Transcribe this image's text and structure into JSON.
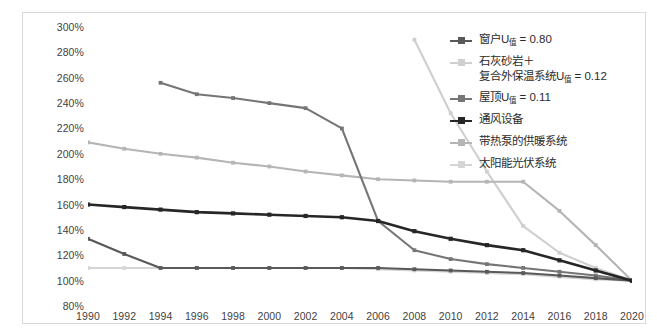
{
  "chart_data": {
    "type": "line",
    "title": "",
    "xlabel": "",
    "ylabel": "",
    "x": [
      1990,
      1992,
      1994,
      1996,
      1998,
      2000,
      2002,
      2004,
      2006,
      2008,
      2010,
      2012,
      2014,
      2016,
      2018,
      2020
    ],
    "xlim": [
      1990,
      2020
    ],
    "ylim": [
      80,
      300
    ],
    "yticks": [
      "80%",
      "100%",
      "120%",
      "140%",
      "160%",
      "180%",
      "200%",
      "220%",
      "240%",
      "260%",
      "280%",
      "300%"
    ],
    "xticks": [
      "1990",
      "1992",
      "1994",
      "1996",
      "1998",
      "2000",
      "2002",
      "2004",
      "2006",
      "2008",
      "2010",
      "2012",
      "2014",
      "2016",
      "2018",
      "2020"
    ],
    "grid": false,
    "legend_position": "top-right",
    "series": [
      {
        "name": "窗户U值 = 0.80",
        "name_base": "窗户U",
        "name_sub": "值",
        "name_rest": " = 0.80",
        "color": "#595959",
        "values": [
          133,
          121,
          110,
          110,
          110,
          110,
          110,
          110,
          110,
          109,
          108,
          107,
          106,
          104,
          102,
          100
        ]
      },
      {
        "name": "石灰砂岩＋\n复合外保温系统U值 = 0.12",
        "name_base": "石灰砂岩＋\n复合外保温系统U",
        "name_sub": "值",
        "name_rest": " = 0.12",
        "color": "#cfcfcf",
        "values": [
          null,
          null,
          null,
          null,
          null,
          null,
          null,
          null,
          null,
          290,
          232,
          186,
          143,
          122,
          110,
          100
        ]
      },
      {
        "name": "屋顶U值 = 0.11",
        "name_base": "屋顶U",
        "name_sub": "值",
        "name_rest": " = 0.11",
        "color": "#757575",
        "values": [
          null,
          null,
          256,
          247,
          244,
          240,
          236,
          220,
          147,
          124,
          117,
          113,
          110,
          107,
          104,
          100
        ]
      },
      {
        "name": "通风设备",
        "name_base": "通风设备",
        "name_sub": "",
        "name_rest": "",
        "color": "#262626",
        "values": [
          160,
          158,
          156,
          154,
          153,
          152,
          151,
          150,
          147,
          139,
          133,
          128,
          124,
          116,
          108,
          100
        ]
      },
      {
        "name": "带热泵的供暖系统",
        "name_base": "带热泵的供暖系统",
        "name_sub": "",
        "name_rest": "",
        "color": "#b5b5b5",
        "values": [
          209,
          204,
          200,
          197,
          193,
          190,
          186,
          183,
          180,
          179,
          178,
          178,
          178,
          155,
          128,
          100
        ]
      },
      {
        "name": "太阳能光伏系统",
        "name_base": "太阳能光伏系统",
        "name_sub": "",
        "name_rest": "",
        "color": "#d5d5d5",
        "values": [
          110,
          110,
          110,
          110,
          110,
          110,
          110,
          110,
          109,
          108,
          107,
          106,
          105,
          103,
          101,
          100
        ]
      }
    ]
  }
}
